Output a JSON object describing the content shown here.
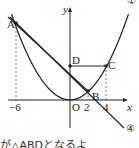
{
  "diagram": {
    "type": "function-graph",
    "labels": {
      "y_axis": "y",
      "x_axis": "x",
      "origin": "O",
      "point_a": "A",
      "point_b": "B",
      "point_c": "C",
      "point_d": "D",
      "tick_neg6": "−6",
      "tick_2": "2",
      "tick_4": "4",
      "curve_label": "①",
      "line_label": "④"
    },
    "parabola": {
      "equation": "y = 1/4 x²",
      "label": "①"
    },
    "line": {
      "label": "④",
      "through": [
        "A",
        "B"
      ]
    },
    "points": {
      "A": [
        -6,
        9
      ],
      "B": [
        2,
        1
      ],
      "C": [
        4,
        4
      ],
      "D": [
        0,
        4
      ]
    },
    "caption": "が△ABDとなるよ"
  }
}
